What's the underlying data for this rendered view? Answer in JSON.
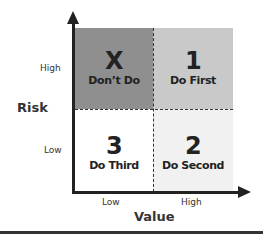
{
  "diagram": {
    "type": "priority-matrix",
    "y_axis": {
      "title": "Risk",
      "ticks": [
        "High",
        "Low"
      ]
    },
    "x_axis": {
      "title": "Value",
      "ticks": [
        "Low",
        "High"
      ]
    },
    "quadrants": [
      {
        "position": "top-left",
        "risk": "High",
        "value": "Low",
        "number": "X",
        "label": "Don’t Do",
        "color": "#8f8f8f"
      },
      {
        "position": "top-right",
        "risk": "High",
        "value": "High",
        "number": "1",
        "label": "Do First",
        "color": "#c9c9c9"
      },
      {
        "position": "bottom-left",
        "risk": "Low",
        "value": "Low",
        "number": "3",
        "label": "Do Third",
        "color": "#ffffff"
      },
      {
        "position": "bottom-right",
        "risk": "Low",
        "value": "High",
        "number": "2",
        "label": "Do Second",
        "color": "#f1f1f1"
      }
    ]
  }
}
